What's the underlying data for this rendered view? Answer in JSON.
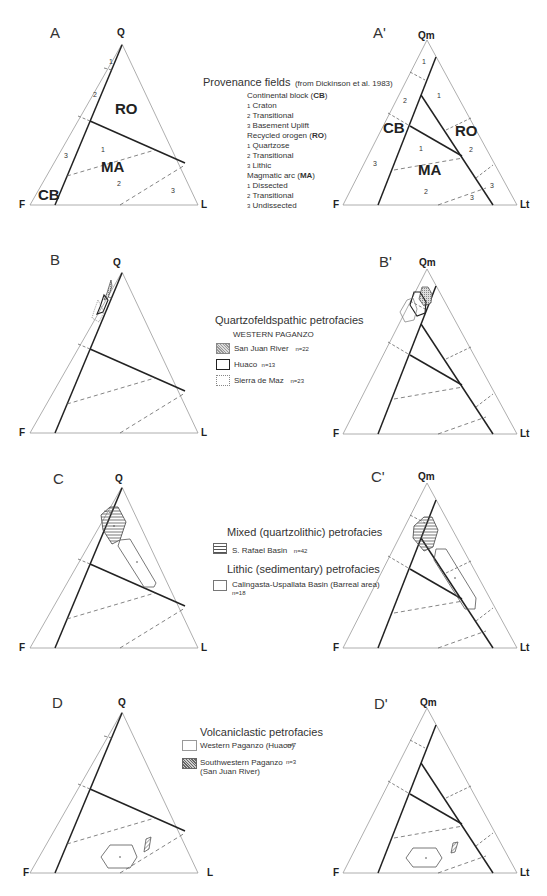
{
  "panels": {
    "A": {
      "label": "A",
      "vertices": {
        "top": "Q",
        "left": "F",
        "right": "L"
      }
    },
    "A_prime": {
      "label": "A'",
      "vertices": {
        "top": "Qm",
        "left": "F",
        "right": "Lt"
      }
    },
    "B": {
      "label": "B",
      "vertices": {
        "top": "Q",
        "left": "F",
        "right": "L"
      }
    },
    "B_prime": {
      "label": "B'",
      "vertices": {
        "top": "Qm",
        "left": "F",
        "right": "Lt"
      }
    },
    "C": {
      "label": "C",
      "vertices": {
        "top": "Q",
        "left": "F",
        "right": "L"
      }
    },
    "C_prime": {
      "label": "C'",
      "vertices": {
        "top": "Qm",
        "left": "F",
        "right": "Lt"
      }
    },
    "D": {
      "label": "D",
      "vertices": {
        "top": "Q",
        "left": "F",
        "right": "L"
      }
    },
    "D_prime": {
      "label": "D'",
      "vertices": {
        "top": "Qm",
        "left": "F",
        "right": "Lt"
      }
    }
  },
  "fields": {
    "ro": "RO",
    "ma": "MA",
    "cb": "CB",
    "n1": "1",
    "n2": "2",
    "n3": "3"
  },
  "legend_a": {
    "title": "Provenance fields",
    "source": "(from Dickinson et al. 1983)",
    "groups": [
      {
        "name": "Continental block (",
        "abbr": "CB",
        "close": ")",
        "items": [
          {
            "n": "1",
            "label": "Craton"
          },
          {
            "n": "2",
            "label": "Transitional"
          },
          {
            "n": "3",
            "label": "Basement Uplift"
          }
        ]
      },
      {
        "name": "Recycled orogen (",
        "abbr": "RO",
        "close": ")",
        "items": [
          {
            "n": "1",
            "label": "Quartzose"
          },
          {
            "n": "2",
            "label": "Transitional"
          },
          {
            "n": "3",
            "label": "Lithic"
          }
        ]
      },
      {
        "name": "Magmatic arc (",
        "abbr": "MA",
        "close": ")",
        "items": [
          {
            "n": "1",
            "label": "Dissected"
          },
          {
            "n": "2",
            "label": "Transitional"
          },
          {
            "n": "3",
            "label": "Undissected"
          }
        ]
      }
    ]
  },
  "legend_b": {
    "title": "Quartzofeldspathic petrofacies",
    "subtitle": "WESTERN PAGANZO",
    "items": [
      {
        "label": "San Juan River",
        "n": "n=22"
      },
      {
        "label": "Huaco",
        "n": "n=13"
      },
      {
        "label": "Sierra de Maz",
        "n": "n=23"
      }
    ]
  },
  "legend_c": {
    "title1": "Mixed (quartzolithic) petrofacies",
    "item1": {
      "label": "S. Rafael Basin",
      "n": "n=42"
    },
    "title2": "Lithic (sedimentary) petrofacies",
    "item2": {
      "label": "Calingasta-Uspallata Basin (Barreal area)",
      "n": "n=18"
    }
  },
  "legend_d": {
    "title": "Volcaniclastic petrofacies",
    "items": [
      {
        "label": "Western Paganzo (Huaco)",
        "n": "n=7"
      },
      {
        "label": "Southwestern Paganzo",
        "label2": "(San Juan River)",
        "n": "n=3"
      }
    ]
  }
}
